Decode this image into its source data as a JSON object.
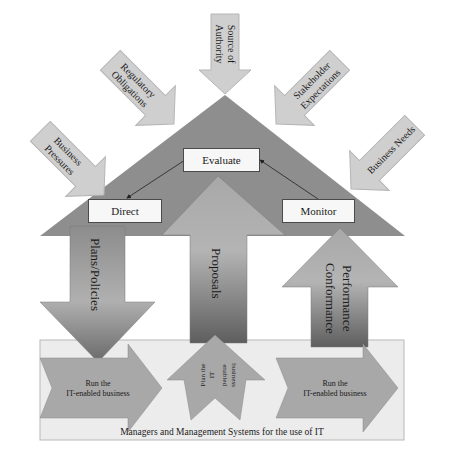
{
  "diagram": {
    "title": "",
    "inputs": [
      {
        "id": "business-pressures",
        "lines": [
          "Business",
          "Pressures"
        ]
      },
      {
        "id": "regulatory-obligations",
        "lines": [
          "Regulatory",
          "Obligations"
        ]
      },
      {
        "id": "source-of-authority",
        "lines": [
          "Source of",
          "Authority"
        ]
      },
      {
        "id": "stakeholder-expectations",
        "lines": [
          "Stakeholder",
          "Expectations"
        ]
      },
      {
        "id": "business-needs",
        "lines": [
          "Business Needs"
        ]
      }
    ],
    "governance": {
      "evaluate": "Evaluate",
      "direct": "Direct",
      "monitor": "Monitor"
    },
    "flows": {
      "plans_policies": "Plans/Policies",
      "proposals": "Proposals",
      "performance": "Performance",
      "conformance": "Conformance"
    },
    "management": {
      "run_left": [
        "Run the",
        "IT-enabled business"
      ],
      "plan": [
        "Plan the",
        "IT",
        "-",
        "enabled",
        "business"
      ],
      "run_right": [
        "Run the",
        "IT-enabled business"
      ],
      "caption": "Managers and Management Systems for the use of IT"
    },
    "colors": {
      "triangle": "#8e8e8e",
      "input_arrow": "#cfcfcf",
      "flow_arrow_top": "#a9a9a9",
      "flow_arrow_bottom": "#6e6e6e",
      "management_box": "#ececec",
      "management_arrow": "#a8a8a8",
      "label_box": "#f7f7f7"
    }
  }
}
